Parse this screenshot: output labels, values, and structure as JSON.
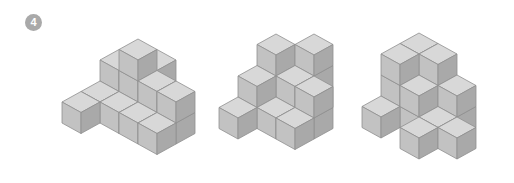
{
  "problem": {
    "number_badge": "4"
  },
  "colors": {
    "top": "#d8d8d8",
    "left": "#c2c2c2",
    "right": "#a9a9a9",
    "edge": "#8f8f8f"
  },
  "projection": {
    "dx": 19,
    "dy": 10.5,
    "h": 21
  },
  "figures": [
    {
      "name": "figure-1",
      "origin": [
        138,
        102
      ],
      "cubes": [
        [
          0,
          0,
          0
        ],
        [
          0,
          0,
          1
        ],
        [
          0,
          0,
          2
        ],
        [
          -1,
          0,
          0
        ],
        [
          -1,
          0,
          1
        ],
        [
          0,
          -1,
          0
        ],
        [
          0,
          -1,
          1
        ],
        [
          1,
          0,
          0
        ],
        [
          1,
          0,
          1
        ],
        [
          0,
          1,
          0
        ],
        [
          1,
          1,
          0
        ],
        [
          -1,
          1,
          0
        ],
        [
          -1,
          2,
          0
        ],
        [
          2,
          0,
          0
        ],
        [
          2,
          0,
          1
        ],
        [
          2,
          1,
          0
        ]
      ]
    },
    {
      "name": "figure-2",
      "origin": [
        276,
        97
      ],
      "cubes": [
        [
          0,
          0,
          0
        ],
        [
          0,
          0,
          1
        ],
        [
          0,
          0,
          2
        ],
        [
          1,
          -1,
          0
        ],
        [
          1,
          -1,
          1
        ],
        [
          1,
          -1,
          2
        ],
        [
          1,
          0,
          0
        ],
        [
          1,
          0,
          1
        ],
        [
          0,
          1,
          0
        ],
        [
          0,
          1,
          1
        ],
        [
          1,
          1,
          0
        ],
        [
          0,
          2,
          0
        ],
        [
          2,
          0,
          0
        ],
        [
          2,
          0,
          1
        ],
        [
          2,
          1,
          0
        ]
      ]
    },
    {
      "name": "figure-3",
      "origin": [
        419,
        96
      ],
      "cubes": [
        [
          0,
          0,
          0
        ],
        [
          0,
          0,
          1
        ],
        [
          0,
          0,
          2
        ],
        [
          1,
          0,
          0
        ],
        [
          1,
          0,
          1
        ],
        [
          1,
          0,
          2
        ],
        [
          0,
          1,
          0
        ],
        [
          0,
          1,
          1
        ],
        [
          0,
          1,
          2
        ],
        [
          1,
          1,
          0
        ],
        [
          1,
          1,
          1
        ],
        [
          2,
          0,
          0
        ],
        [
          2,
          0,
          1
        ],
        [
          0,
          2,
          0
        ],
        [
          2,
          1,
          0
        ],
        [
          2,
          2,
          0
        ],
        [
          3,
          1,
          0
        ]
      ]
    }
  ]
}
